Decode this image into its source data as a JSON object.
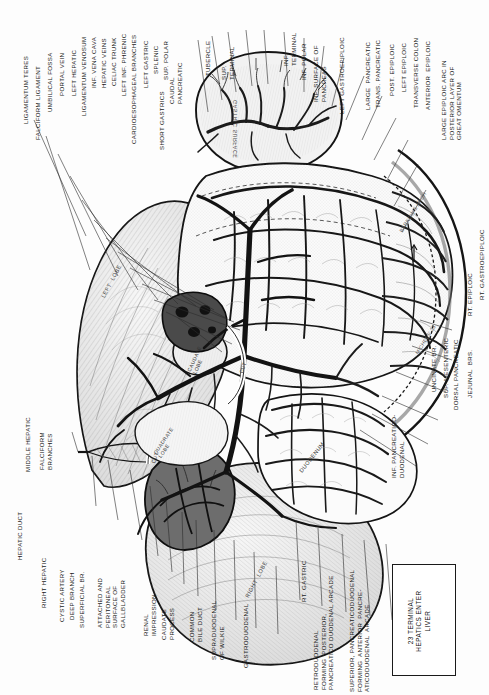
{
  "figure": {
    "orientation": "labels rotated 90 degrees (landscape plate printed in portrait)",
    "ink": "#1a1a1a",
    "paper": "#fdfdfd"
  },
  "boxed_caption": {
    "lines": "23 TERMINAL\nHEPATICS ENTER\nLIVER"
  },
  "labels_left_edge": [
    {
      "id": "ligamentum-teres",
      "text": "LIGAMENTUM TERES"
    },
    {
      "id": "falciform-ligament",
      "text": "FALCIFORM LIGAMENT"
    },
    {
      "id": "middle-hepatic",
      "text": "MIDDLE HEPATIC"
    },
    {
      "id": "falciform-branches",
      "text": "FALCIFORM\nBRANCHES"
    },
    {
      "id": "hepatic-duct",
      "text": "HEPATIC DUCT"
    },
    {
      "id": "right-hepatic",
      "text": "RIGHT HEPATIC"
    },
    {
      "id": "cystic-artery",
      "text": "CYSTIC ARTERY"
    },
    {
      "id": "deep-branch",
      "text": "DEEP BRANCH"
    },
    {
      "id": "superficial-br",
      "text": "SUPERFICIAL BR."
    },
    {
      "id": "attached-peritoneal",
      "text": "ATTACHED AND\nPERITONEAL\nSURFACE OF\nGALLBLADDER"
    },
    {
      "id": "renal-impression",
      "text": "RENAL\nIMPRESSION"
    },
    {
      "id": "caudate-process",
      "text": "CAUDATE\nPROCESS"
    },
    {
      "id": "common-bile-duct",
      "text": "COMMON\nBILE DUCT"
    },
    {
      "id": "supraduodenal-wilkie",
      "text": "SUPRADUODENAL\nOF WILKIE"
    },
    {
      "id": "gastroduodenal",
      "text": "GASTRODUODENAL"
    }
  ],
  "labels_top_left": [
    {
      "id": "umbilical-fossa",
      "text": "UMBILICAL FOSSA"
    },
    {
      "id": "portal-vein",
      "text": "PORTAL VEIN"
    },
    {
      "id": "left-hepatic",
      "text": "LEFT HEPATIC"
    },
    {
      "id": "ligamentum-venosum",
      "text": "LIGAMENTUM VENOSUM"
    },
    {
      "id": "inf-vena-cava",
      "text": "INF. VENA CAVA"
    },
    {
      "id": "hepatic-veins",
      "text": "HEPATIC VEINS"
    },
    {
      "id": "celiac-trunk",
      "text": "CELIAC TRUNK"
    },
    {
      "id": "left-inf-phrenic",
      "text": "LEFT INF. PHRENIC"
    },
    {
      "id": "cardioesophageal",
      "text": "CARDIOESOPHAGEAL BRANCHES"
    },
    {
      "id": "left-gastric",
      "text": "LEFT GASTRIC"
    },
    {
      "id": "splenic",
      "text": "SPLENIC"
    },
    {
      "id": "sup-polar",
      "text": "SUP. POLAR"
    },
    {
      "id": "short-gastrics",
      "text": "SHORT GASTRICS"
    },
    {
      "id": "caudal-pancreatic",
      "text": "CAUDAL\nPANCREATIC"
    },
    {
      "id": "tubercle",
      "text": "TUBERCLE"
    },
    {
      "id": "sup-terminal",
      "text": "SUP.\nTERMINAL"
    },
    {
      "id": "inf-terminal",
      "text": "INF.\nTERMINAL"
    }
  ],
  "labels_top_right": [
    {
      "id": "inf-polar",
      "text": "INF. POLAR"
    },
    {
      "id": "inf-surface-pancreas",
      "text": "INF. SURFACE OF\nPANCREAS"
    },
    {
      "id": "left-gastroepiploic",
      "text": "LEFT GASTROEPIPLOIC"
    },
    {
      "id": "large-pancreatic",
      "text": "LARGE  PANCREATIC"
    },
    {
      "id": "trans-pancreatic",
      "text": "TRANS. PANCREATIC"
    },
    {
      "id": "post-epiploic",
      "text": "POST. EPIPLOIC"
    },
    {
      "id": "left-epiploic",
      "text": "LEFT EPIPLOIC"
    },
    {
      "id": "transverse-colon",
      "text": "TRANSVERSE COLON"
    },
    {
      "id": "anterior-epiploic",
      "text": "ANTERIOR  EPIPLOIC"
    },
    {
      "id": "large-epiploic-arc",
      "text": "LARGE EPIPLOIC ARC IN\nPOSTERIOR LAYER OF\nGREAT OMENTUM"
    }
  ],
  "labels_right_edge": [
    {
      "id": "rt-gastroepiploic",
      "text": "RT. GASTROEPIPLOIC"
    },
    {
      "id": "rt-epiploic",
      "text": "RT. EPIPLOIC"
    },
    {
      "id": "uncinate-br",
      "text": "UNCINATE BR."
    },
    {
      "id": "sup-mesenteric",
      "text": "SUP. MESENTERIC"
    },
    {
      "id": "dorsal-pancreatic",
      "text": "DORSAL PANCREATIC"
    },
    {
      "id": "jejunal-brs",
      "text": "JEJUNAL  BRS."
    },
    {
      "id": "inf-pancreatico-duodenal",
      "text": "INF. PANCREATICO-\nDUODENAL"
    }
  ],
  "labels_bottom": [
    {
      "id": "rt-gastric",
      "text": "RT. GASTRIC"
    },
    {
      "id": "retroduodenal",
      "text": "RETRODUODENAL\nFORMING  POSTERIOR,\nPANCREATICO DUODENAL ARCADE"
    },
    {
      "id": "superior-pancreaticoduodenal",
      "text": "SUPERIOR, PANCREATICODUODENAL\nFORMING  ANTERIOR  PANCRE-\nATICODUODENAL  ARCADE"
    }
  ],
  "inner_labels": [
    {
      "id": "left-lobe",
      "text": "LEFT  LOBE"
    },
    {
      "id": "right-lobe",
      "text": "RIGHT  LOBE"
    },
    {
      "id": "quadrate-lobe",
      "text": "QUADRATE\nLOBE"
    },
    {
      "id": "caudate-lobe",
      "text": "CAUDATE\nLOBE"
    },
    {
      "id": "cut-1",
      "text": "CUT"
    },
    {
      "id": "cut-2",
      "text": "CUT"
    },
    {
      "id": "duodenum",
      "text": "DUODENUM"
    },
    {
      "id": "gastric-surface",
      "text": "GASTRIC SURFACE"
    },
    {
      "id": "barkows-arch",
      "text": "BARKOW'S ARCH"
    },
    {
      "id": "michels-23",
      "text": "MICHELS' 23"
    }
  ]
}
